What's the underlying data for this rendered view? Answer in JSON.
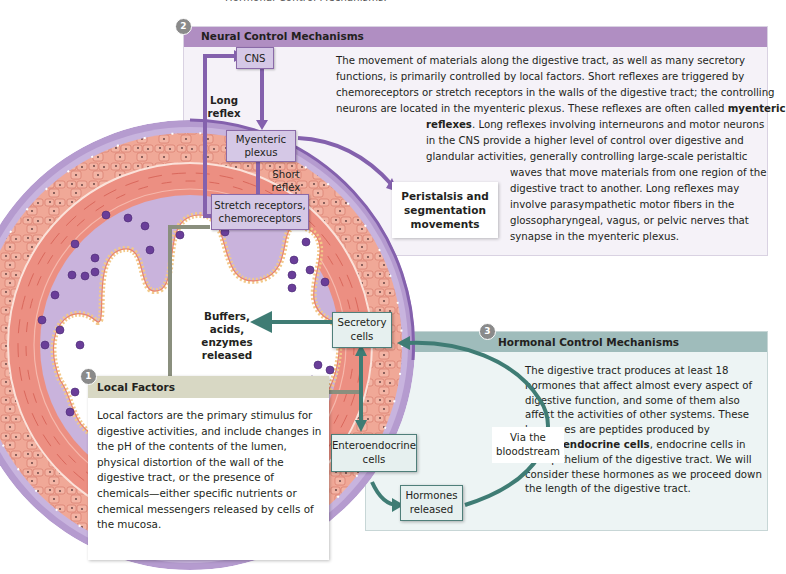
{
  "cropped_top_text": "Hormonal Control Mechanisms.",
  "colors": {
    "neural_header": "#b08ec2",
    "neural_bg": "#f5f2f8",
    "neural_arrow": "#8461ad",
    "hormonal_header": "#9fbcbb",
    "hormonal_bg": "#edf4f4",
    "hormonal_arrow": "#3f7c74",
    "local_header": "#d8d8c4",
    "local_line": "#8a8f7e",
    "muscle": "#e8857a",
    "mucosa": "#c9b3dc",
    "badge": "#8a8a8a"
  },
  "panels": {
    "neural": {
      "badge": "2",
      "title": "Neural Control Mechanisms",
      "lines": [
        "The movement of materials along the digestive tract, as well as many secretory",
        "functions, is primarily controlled by local factors. Short reflexes are triggered by",
        "chemoreceptors or stretch receptors in the walls of the digestive tract; the controlling",
        "neurons are located in the myenteric plexus. These reflexes are often called",
        "myenteric",
        "reflexes",
        ". Long reflexes involving interneurons and motor neurons",
        "in the CNS provide a higher level of control over digestive and",
        "glandular activities, generally controlling large-scale peristaltic",
        "waves that move materials from one region of the",
        "digestive tract to another. Long reflexes may",
        "involve parasympathetic motor fibers in the",
        "glossopharyngeal, vagus, or pelvic nerves that",
        "synapse in the myenteric plexus."
      ]
    },
    "hormonal": {
      "badge": "3",
      "title": "Hormonal Control Mechanisms",
      "text_before": "The digestive tract produces at least 18 hormones that affect almost every aspect of digestive function, and some of them also affect the activities of other systems. These hormones are peptides produced by ",
      "text_bold": "enteroendocrine cells",
      "text_after": ", endocrine cells in the epithelium of the digestive tract. We will consider these hormones as we proceed down the length of the digestive tract."
    },
    "local": {
      "badge": "1",
      "title": "Local Factors",
      "text": "Local factors are the primary stimulus for digestive activities, and include changes in the pH of the contents of the lumen, physical distortion of the wall of the digestive tract, or the presence of chemicals—either specific nutrients or chemical messengers released by cells of the mucosa."
    }
  },
  "diagram_labels": {
    "cns": "CNS",
    "long_reflex_1": "Long",
    "long_reflex_2": "reflex",
    "myenteric_plexus_1": "Myenteric",
    "myenteric_plexus_2": "plexus",
    "short_reflex_1": "Short",
    "short_reflex_2": "reflex",
    "stretch_receptors_1": "Stretch receptors,",
    "stretch_receptors_2": "chemoreceptors",
    "peristalsis_1": "Peristalsis and",
    "peristalsis_2": "segmentation",
    "peristalsis_3": "movements",
    "buffers_1": "Buffers, acids,",
    "buffers_2": "enzymes released",
    "secretory_1": "Secretory",
    "secretory_2": "cells",
    "enteroendocrine_1": "Enteroendocrine",
    "enteroendocrine_2": "cells",
    "hormones_1": "Hormones",
    "hormones_2": "released",
    "bloodstream_1": "Via the",
    "bloodstream_2": "bloodstream"
  }
}
